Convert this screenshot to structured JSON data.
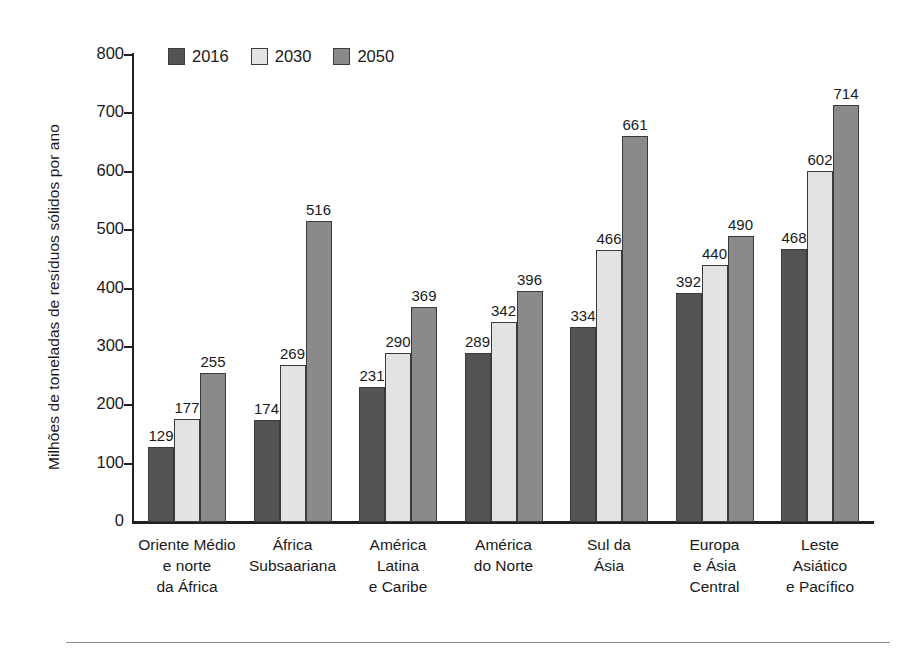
{
  "chart_data": {
    "type": "bar",
    "title": "",
    "xlabel": "",
    "ylabel": "Milhões de toneladas de resíduos sólidos por ano",
    "ylim": [
      0,
      800
    ],
    "yticks": [
      0,
      100,
      200,
      300,
      400,
      500,
      600,
      700,
      800
    ],
    "ytick_labels": [
      "0",
      "100",
      "200",
      "300",
      "400",
      "500",
      "600",
      "700",
      "800"
    ],
    "grid": false,
    "legend_position": "top-left",
    "categories": [
      "Oriente Médio\ne norte\nda África",
      "África\nSubsaariana",
      "América\nLatina\ne Caribe",
      "América\ndo Norte",
      "Sul da\nÁsia",
      "Europa\ne Ásia\nCentral",
      "Leste\nAsiático\ne Pacífico"
    ],
    "series": [
      {
        "name": "2016",
        "color": "#545454",
        "values": [
          129,
          174,
          231,
          289,
          334,
          392,
          468
        ]
      },
      {
        "name": "2030",
        "color": "#e3e3e3",
        "values": [
          177,
          269,
          290,
          342,
          466,
          440,
          602
        ]
      },
      {
        "name": "2050",
        "color": "#8a8a8a",
        "values": [
          255,
          516,
          369,
          396,
          661,
          490,
          714
        ]
      }
    ]
  },
  "axis": {
    "line_color": "#231f20"
  },
  "footer": {
    "rule_color": "#8e8e8e"
  }
}
